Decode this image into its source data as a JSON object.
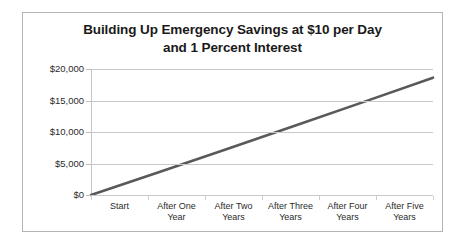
{
  "chart_data": {
    "type": "line",
    "title": "Building Up Emergency Savings at $10 per Day and 1 Percent Interest",
    "title_line1": "Building Up Emergency Savings at $10 per Day",
    "title_line2": "and 1 Percent Interest",
    "xlabel": "",
    "ylabel": "",
    "categories": [
      "Start",
      "After One Year",
      "After Two Years",
      "After Three Years",
      "After Four Years",
      "After Five Years"
    ],
    "category_lines": [
      [
        "Start"
      ],
      [
        "After One",
        "Year"
      ],
      [
        "After Two",
        "Years"
      ],
      [
        "After Three",
        "Years"
      ],
      [
        "After Four",
        "Years"
      ],
      [
        "After Five",
        "Years"
      ]
    ],
    "values": [
      0,
      3650,
      7337,
      11060,
      14821,
      18619
    ],
    "series": [
      {
        "name": "Savings Balance",
        "values": [
          0,
          3650,
          7337,
          11060,
          14821,
          18619
        ],
        "color": "#595959"
      }
    ],
    "ylim": [
      0,
      20000
    ],
    "yticks": [
      0,
      5000,
      10000,
      15000,
      20000
    ],
    "ytick_labels": [
      "$0",
      "$5,000",
      "$10,000",
      "$15,000",
      "$20,000"
    ],
    "grid": true,
    "legend": false,
    "legend_position": "none",
    "line_color": "#595959",
    "grid_color": "#c9c9c9",
    "border_color": "#b4b4b4",
    "text_color": "#2b2b2b",
    "title_color": "#1a1a1a",
    "background": "#ffffff"
  }
}
